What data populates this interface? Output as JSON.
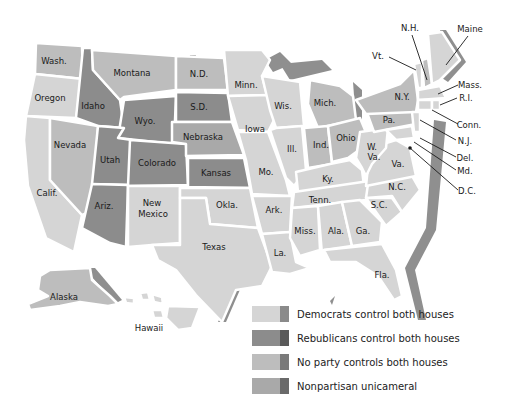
{
  "colors": {
    "democrats": "#d5d5d5",
    "democrats_edge": "#8a8a8a",
    "republicans": "#8c8c8c",
    "republicans_edge": "#5a5a5a",
    "no_party": "#bdbdbd",
    "no_party_edge": "#7a7a7a",
    "nonpartisan": "#a9a9a9",
    "nonpartisan_edge": "#6a6a6a",
    "coast_shadow": "#8f8f8f"
  },
  "states": {
    "wash": "Wash.",
    "oregon": "Oregon",
    "calif": "Calif.",
    "idaho": "Idaho",
    "nevada": "Nevada",
    "montana": "Montana",
    "wyo": "Wyo.",
    "utah": "Utah",
    "ariz": "Ariz.",
    "colorado": "Colorado",
    "new": "New",
    "mexico": "Mexico",
    "nd": "N.D.",
    "sd": "S.D.",
    "nebraska": "Nebraska",
    "kansas": "Kansas",
    "okla": "Okla.",
    "texas": "Texas",
    "minn": "Minn.",
    "iowa": "Iowa",
    "mo": "Mo.",
    "ark": "Ark.",
    "la": "La.",
    "wis": "Wis.",
    "ill": "Ill.",
    "mich": "Mich.",
    "ind": "Ind.",
    "ohio": "Ohio",
    "ky": "Ky.",
    "tenn": "Tenn.",
    "miss": "Miss.",
    "ala": "Ala.",
    "ga": "Ga.",
    "fla": "Fla.",
    "sc": "S.C.",
    "nc": "N.C.",
    "va": "Va.",
    "w": "W.",
    "wva": "Va.",
    "pa": "Pa.",
    "ny": "N.Y.",
    "vt": "Vt.",
    "nh": "N.H.",
    "maine": "Maine",
    "mass": "Mass.",
    "ri": "R.I.",
    "conn": "Conn.",
    "nj": "N.J.",
    "del": "Del.",
    "md": "Md.",
    "dc": "D.C.",
    "alaska": "Alaska",
    "hawaii": "Hawaii"
  },
  "legend": [
    {
      "label": "Democrats control both houses",
      "key": "democrats"
    },
    {
      "label": "Rebublicans control both houses",
      "key": "republicans"
    },
    {
      "label": "No party controls both houses",
      "key": "no_party"
    },
    {
      "label": "Nonpartisan unicameral",
      "key": "nonpartisan"
    }
  ]
}
